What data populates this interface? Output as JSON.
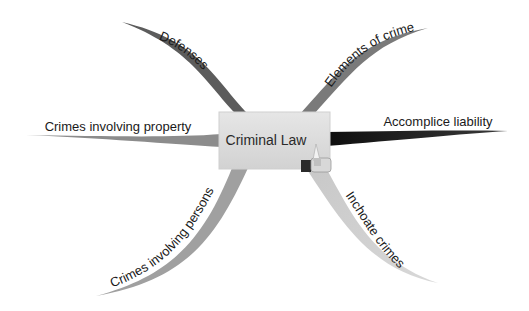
{
  "diagram": {
    "type": "mind-map",
    "center": {
      "label": "Criminal Law",
      "icon": "pencil-eraser-icon"
    },
    "branches": [
      {
        "id": "defenses",
        "label": "Defenses",
        "color": "#5a5a5a"
      },
      {
        "id": "elements",
        "label": "Elements of crime",
        "color": "#7a7a7a"
      },
      {
        "id": "accomplice",
        "label": "Accomplice liability",
        "color": "#151515"
      },
      {
        "id": "property",
        "label": "Crimes involving property",
        "color": "#8c8c8c"
      },
      {
        "id": "persons",
        "label": "Crimes involving persons",
        "color": "#a0a0a0"
      },
      {
        "id": "inchoate",
        "label": "Inchoate crimes",
        "color": "#c4c4c4"
      }
    ]
  }
}
